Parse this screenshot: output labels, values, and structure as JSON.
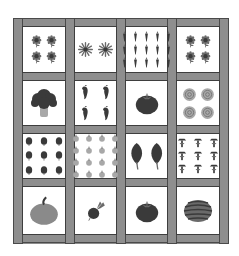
{
  "garden": {
    "rows": 4,
    "cols": 4,
    "colors": {
      "wood": "#8e8e8e",
      "wood_edge": "#4a4a4a",
      "soil_card": "#ffffff",
      "plant_dark": "#3a3a3a",
      "plant_mid": "#6a6a6a",
      "plant_light": "#a8a8a8"
    },
    "cells": [
      {
        "row": 0,
        "col": 0,
        "plant": "sunflower",
        "count": 4,
        "grid": [
          2,
          2
        ]
      },
      {
        "row": 0,
        "col": 1,
        "plant": "aster",
        "count": 2,
        "grid": [
          2,
          1
        ]
      },
      {
        "row": 0,
        "col": 2,
        "plant": "carrot",
        "count": 15,
        "grid": [
          5,
          3
        ]
      },
      {
        "row": 0,
        "col": 3,
        "plant": "sunflower",
        "count": 4,
        "grid": [
          2,
          2
        ]
      },
      {
        "row": 1,
        "col": 0,
        "plant": "broccoli",
        "count": 1,
        "grid": [
          1,
          1
        ]
      },
      {
        "row": 1,
        "col": 1,
        "plant": "pepper",
        "count": 4,
        "grid": [
          2,
          2
        ]
      },
      {
        "row": 1,
        "col": 2,
        "plant": "tomato",
        "count": 1,
        "grid": [
          1,
          1
        ]
      },
      {
        "row": 1,
        "col": 3,
        "plant": "cabbage",
        "count": 4,
        "grid": [
          2,
          2
        ]
      },
      {
        "row": 2,
        "col": 0,
        "plant": "basil",
        "count": 9,
        "grid": [
          3,
          3
        ]
      },
      {
        "row": 2,
        "col": 1,
        "plant": "onion",
        "count": 16,
        "grid": [
          4,
          4
        ]
      },
      {
        "row": 2,
        "col": 2,
        "plant": "spinach",
        "count": 2,
        "grid": [
          2,
          1
        ]
      },
      {
        "row": 2,
        "col": 3,
        "plant": "corn",
        "count": 9,
        "grid": [
          3,
          3
        ]
      },
      {
        "row": 3,
        "col": 0,
        "plant": "pumpkin",
        "count": 1,
        "grid": [
          1,
          1
        ]
      },
      {
        "row": 3,
        "col": 1,
        "plant": "beet",
        "count": 1,
        "grid": [
          1,
          1
        ]
      },
      {
        "row": 3,
        "col": 2,
        "plant": "tomato",
        "count": 1,
        "grid": [
          1,
          1
        ]
      },
      {
        "row": 3,
        "col": 3,
        "plant": "watermelon",
        "count": 1,
        "grid": [
          1,
          1
        ]
      }
    ]
  }
}
